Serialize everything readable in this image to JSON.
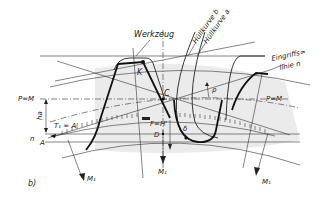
{
  "diagram": {
    "panel_label": "b)",
    "labels": {
      "werkzeug": "Werkzeug",
      "huellkurve_b": "Hüllkurve b",
      "huellkurve_a": "Hüllkurve a",
      "eingriffslinie_1": "Eingriffs=",
      "eingriffslinie_2": "linie n",
      "pm_left": "P=M",
      "pm_right": "P=M",
      "k": "K",
      "c": "C",
      "rho": "ρ",
      "ha": "ha",
      "t1": "T₁ = A'",
      "fh": "F=H'",
      "d": "D",
      "delta": "δ",
      "n": "n",
      "a": "A",
      "m1_left": "M₁",
      "m1_center": "M₁",
      "m1_right": "M₁"
    },
    "colors": {
      "line": "#222222",
      "shade": "#e6e6e6",
      "background": "#ffffff"
    }
  }
}
